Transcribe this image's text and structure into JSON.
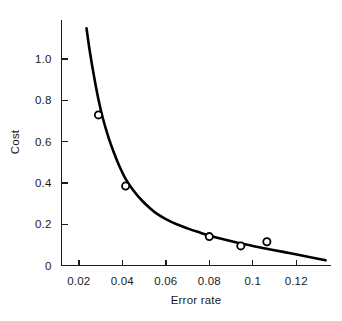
{
  "chart_data": {
    "type": "line",
    "title": "",
    "xlabel": "Error rate",
    "ylabel": "Cost",
    "xlim": [
      0.012,
      0.136
    ],
    "ylim": [
      0,
      1.19
    ],
    "grid": false,
    "legend": "none",
    "xticks": [
      0.02,
      0.04,
      0.06,
      0.08,
      0.1,
      0.12
    ],
    "xtick_labels": [
      "0.02",
      "0.04",
      "0.06",
      "0.08",
      "0.1",
      "0.12"
    ],
    "yticks": [
      0,
      0.2,
      0.4,
      0.6,
      0.8,
      1.0
    ],
    "ytick_labels": [
      "0",
      "0.2",
      "0.4",
      "0.6",
      "0.8",
      "1.0"
    ],
    "series": [
      {
        "name": "fitted-curve",
        "style": "line",
        "x": [
          0.0235,
          0.025,
          0.027,
          0.029,
          0.031,
          0.0335,
          0.036,
          0.0385,
          0.0415,
          0.045,
          0.049,
          0.053,
          0.056,
          0.06,
          0.065,
          0.07,
          0.075,
          0.08,
          0.086,
          0.094,
          0.1,
          0.107,
          0.114,
          0.122,
          0.1335
        ],
        "y": [
          1.15,
          1.04,
          0.915,
          0.805,
          0.715,
          0.625,
          0.55,
          0.485,
          0.42,
          0.365,
          0.315,
          0.275,
          0.25,
          0.225,
          0.2,
          0.18,
          0.162,
          0.145,
          0.128,
          0.108,
          0.095,
          0.08,
          0.066,
          0.05,
          0.025
        ]
      },
      {
        "name": "observed-points",
        "style": "markers",
        "x": [
          0.029,
          0.0415,
          0.08,
          0.0945,
          0.1065
        ],
        "y": [
          0.73,
          0.385,
          0.14,
          0.095,
          0.115
        ]
      }
    ]
  },
  "figure": {
    "background_color": "#ffffff",
    "ink_color": "#000000",
    "marker_fill": "#ffffff"
  }
}
